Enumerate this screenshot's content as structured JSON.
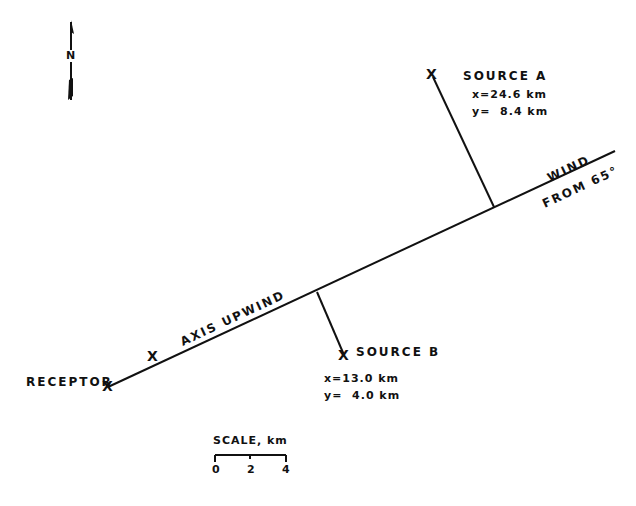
{
  "north_arrow": {
    "label": "N"
  },
  "wind_axis": {
    "label_above": "WIND",
    "label_below": "FROM 65°",
    "axis_label": "AXIS UPWIND",
    "axis_marker": "X"
  },
  "receptor": {
    "label": "RECEPTOR",
    "marker": "X"
  },
  "source_a": {
    "label": "SOURCE A",
    "marker": "X",
    "x": "x=24.6 km",
    "y": "y=  8.4 km"
  },
  "source_b": {
    "label": "SOURCE B",
    "marker": "X",
    "x": "x=13.0 km",
    "y": "y=  4.0 km"
  },
  "scale": {
    "title": "SCALE, km",
    "ticks": [
      "0",
      "2",
      "4"
    ]
  },
  "colors": {
    "ink": "#111111",
    "background": "#ffffff"
  }
}
